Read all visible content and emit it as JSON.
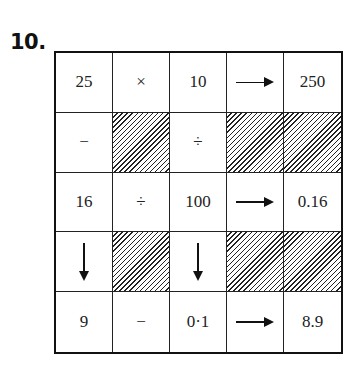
{
  "question_number": "10.",
  "grid": {
    "rows": [
      [
        {
          "type": "text",
          "value": "25"
        },
        {
          "type": "text",
          "value": "×"
        },
        {
          "type": "text",
          "value": "10"
        },
        {
          "type": "arrow",
          "value": "arrow-right"
        },
        {
          "type": "text",
          "value": "250"
        }
      ],
      [
        {
          "type": "text",
          "value": "−"
        },
        {
          "type": "hatched",
          "value": ""
        },
        {
          "type": "text",
          "value": "÷"
        },
        {
          "type": "hatched",
          "value": ""
        },
        {
          "type": "hatched",
          "value": ""
        }
      ],
      [
        {
          "type": "text",
          "value": "16"
        },
        {
          "type": "text",
          "value": "÷"
        },
        {
          "type": "text",
          "value": "100"
        },
        {
          "type": "arrow",
          "value": "arrow-right"
        },
        {
          "type": "text",
          "value": "0.16"
        }
      ],
      [
        {
          "type": "arrow",
          "value": "arrow-down"
        },
        {
          "type": "hatched",
          "value": ""
        },
        {
          "type": "arrow",
          "value": "arrow-down"
        },
        {
          "type": "hatched",
          "value": ""
        },
        {
          "type": "hatched",
          "value": ""
        }
      ],
      [
        {
          "type": "text",
          "value": "9"
        },
        {
          "type": "text",
          "value": "−"
        },
        {
          "type": "text",
          "value": "0·1"
        },
        {
          "type": "arrow",
          "value": "arrow-right"
        },
        {
          "type": "text",
          "value": "8.9"
        }
      ]
    ]
  },
  "cells": {
    "r0c0": "25",
    "r0c1": "×",
    "r0c2": "10",
    "r0c4": "250",
    "r1c0": "−",
    "r1c2": "÷",
    "r2c0": "16",
    "r2c1": "÷",
    "r2c2": "100",
    "r2c4": "0.16",
    "r4c0": "9",
    "r4c1": "−",
    "r4c2": "0·1",
    "r4c4": "8.9"
  }
}
